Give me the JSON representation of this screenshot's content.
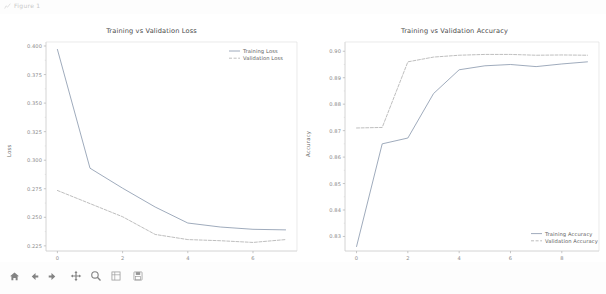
{
  "window": {
    "title": "Figure 1",
    "icon": "figure-icon"
  },
  "toolbar": {
    "items": [
      {
        "name": "home-button",
        "label": "Home",
        "icon": "home-icon"
      },
      {
        "name": "back-button",
        "label": "Back",
        "icon": "arrow-left-icon"
      },
      {
        "name": "forward-button",
        "label": "Forward",
        "icon": "arrow-right-icon"
      },
      {
        "name": "pan-button",
        "label": "Pan",
        "icon": "move-cross-icon"
      },
      {
        "name": "zoom-button",
        "label": "Zoom to rectangle",
        "icon": "magnifier-icon"
      },
      {
        "name": "subplots-button",
        "label": "Configure subplots",
        "icon": "sliders-icon"
      },
      {
        "name": "save-button",
        "label": "Save the figure",
        "icon": "save-disk-icon"
      }
    ]
  },
  "chart_data": [
    {
      "type": "line",
      "id": "loss",
      "title": "Training vs Validation Loss",
      "xlabel": "Epochs",
      "ylabel": "Loss",
      "x": [
        0,
        1,
        2,
        3,
        4,
        5,
        6,
        7
      ],
      "xlim": [
        -0.35,
        7.35
      ],
      "ylim": [
        0.2205,
        0.4035
      ],
      "xticks": [
        0,
        2,
        4,
        6
      ],
      "xticklabels": [
        "0",
        "2",
        "4",
        "6"
      ],
      "yticks": [
        0.225,
        0.25,
        0.275,
        0.3,
        0.325,
        0.35,
        0.375,
        0.4
      ],
      "yticklabels": [
        "0.225",
        "0.250",
        "0.275",
        "0.300",
        "0.325",
        "0.350",
        "0.375",
        "0.400"
      ],
      "grid": false,
      "legend_position": "upper right",
      "series": [
        {
          "name": "Training Loss",
          "color": "#7f8fa6",
          "linestyle": "solid",
          "values": [
            0.397,
            0.293,
            0.2755,
            0.259,
            0.245,
            0.2415,
            0.2395,
            0.239
          ]
        },
        {
          "name": "Validation Loss",
          "color": "#a8a8a8",
          "linestyle": "dashed",
          "values": [
            0.2735,
            0.262,
            0.2505,
            0.235,
            0.2305,
            0.2295,
            0.228,
            0.2305
          ]
        }
      ]
    },
    {
      "type": "line",
      "id": "accuracy",
      "title": "Training vs Validation Accuracy",
      "xlabel": "Epochs",
      "ylabel": "Accuracy",
      "x": [
        0,
        1,
        2,
        3,
        4,
        5,
        6,
        7,
        8,
        9
      ],
      "xlim": [
        -0.45,
        9.45
      ],
      "ylim": [
        0.8245,
        0.9035
      ],
      "xticks": [
        0,
        2,
        4,
        6,
        8
      ],
      "xticklabels": [
        "0",
        "2",
        "4",
        "6",
        "8"
      ],
      "yticks": [
        0.83,
        0.84,
        0.85,
        0.86,
        0.87,
        0.88,
        0.89,
        0.9
      ],
      "yticklabels": [
        "0.83",
        "0.84",
        "0.85",
        "0.86",
        "0.87",
        "0.88",
        "0.89",
        "0.90"
      ],
      "grid": false,
      "legend_position": "lower right",
      "series": [
        {
          "name": "Training Accuracy",
          "color": "#7f8fa6",
          "linestyle": "solid",
          "values": [
            0.8262,
            0.865,
            0.8672,
            0.884,
            0.893,
            0.8945,
            0.895,
            0.8942,
            0.8952,
            0.896
          ]
        },
        {
          "name": "Validation Accuracy",
          "color": "#a8a8a8",
          "linestyle": "dashed",
          "values": [
            0.871,
            0.8712,
            0.896,
            0.8978,
            0.8985,
            0.8988,
            0.8988,
            0.8985,
            0.8986,
            0.8985
          ]
        }
      ]
    }
  ]
}
